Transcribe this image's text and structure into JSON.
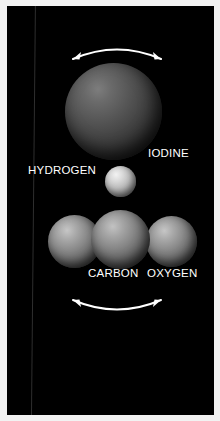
{
  "figure": {
    "background_color": "#000000",
    "frame_color": "#f2f2f2",
    "label_color": "#ffffff",
    "arrow_color": "#ffffff",
    "seam_line_color": "#2e2e2e"
  },
  "molecules": [
    {
      "id": "hydrogen-iodide",
      "position": "top",
      "atoms": [
        {
          "name": "iodine",
          "label": "IODINE",
          "relative_size": "large",
          "color": "#555555"
        },
        {
          "name": "hydrogen",
          "label": "HYDROGEN",
          "relative_size": "small",
          "color": "#bdbdbd"
        }
      ],
      "vibration_arrow": {
        "name": "vibration-arrow-top",
        "style": "double-headed-curved",
        "curve_direction": "arc-up"
      }
    },
    {
      "id": "carbon-dioxide",
      "position": "bottom",
      "atoms": [
        {
          "name": "oxygen-left",
          "label": "",
          "relative_size": "medium",
          "color": "#8c8c8c"
        },
        {
          "name": "carbon",
          "label": "CARBON",
          "relative_size": "large",
          "color": "#888888"
        },
        {
          "name": "oxygen-right",
          "label": "OXYGEN",
          "relative_size": "medium",
          "color": "#8c8c8c"
        }
      ],
      "vibration_arrow": {
        "name": "vibration-arrow-bottom",
        "style": "double-headed-curved",
        "curve_direction": "arc-down"
      }
    }
  ],
  "labels": {
    "iodine": "IODINE",
    "hydrogen": "HYDROGEN",
    "carbon": "CARBON",
    "oxygen": "OXYGEN"
  }
}
